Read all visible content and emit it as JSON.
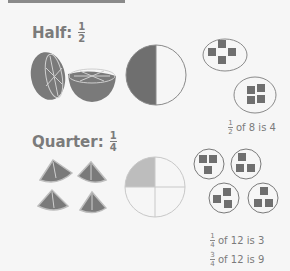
{
  "sections": [
    {
      "title": "Half:",
      "fraction": {
        "num": "1",
        "den": "2"
      },
      "captions": [
        {
          "fraction": {
            "num": "1",
            "den": "2"
          },
          "text": "of 8 is 4"
        }
      ]
    },
    {
      "title": "Quarter:",
      "fraction": {
        "num": "1",
        "den": "4"
      },
      "captions": [
        {
          "fraction": {
            "num": "1",
            "den": "4"
          },
          "text": "of 12 is 3"
        },
        {
          "fraction": {
            "num": "3",
            "den": "4"
          },
          "text": "of 12 is 9"
        }
      ]
    }
  ],
  "colors": {
    "fill_dark": "#6f6f6f",
    "fill_light": "#bdbdbd",
    "stroke": "#8a8a8a",
    "background": "#f6f6f6"
  }
}
